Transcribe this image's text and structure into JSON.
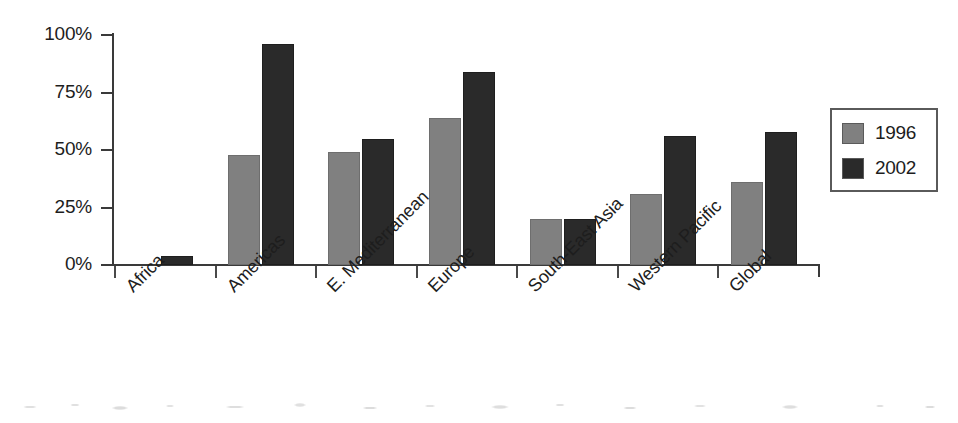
{
  "chart_data": {
    "type": "bar",
    "title": "",
    "subtitle": "",
    "xlabel": "",
    "ylabel": "",
    "ylim": [
      0,
      100
    ],
    "yticks": [
      "0%",
      "25%",
      "50%",
      "75%",
      "100%"
    ],
    "ytick_values": [
      0,
      25,
      50,
      75,
      100
    ],
    "grid": false,
    "legend_position": "right",
    "categories": [
      "Africa",
      "Americas",
      "E. Mediterranean",
      "Europe",
      "South-East Asia",
      "Western Pacific",
      "Global"
    ],
    "series": [
      {
        "name": "1996",
        "color": "#808080",
        "values": [
          0,
          48,
          49,
          64,
          20,
          31,
          36
        ]
      },
      {
        "name": "2002",
        "color": "#2a2a2a",
        "values": [
          4,
          96,
          55,
          84,
          20,
          56,
          58
        ]
      }
    ]
  },
  "legend": {
    "entries": [
      {
        "label": "1996",
        "swatch": "series-1996-swatch"
      },
      {
        "label": "2002",
        "swatch": "series-2002-swatch"
      }
    ]
  },
  "colors": {
    "series_1996": "#808080",
    "series_2002": "#2a2a2a",
    "axis": "#3a3a3a",
    "text": "#1d1d1d",
    "background": "#ffffff"
  }
}
